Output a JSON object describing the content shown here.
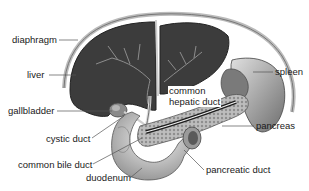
{
  "diagram": {
    "type": "anatomical-illustration",
    "labels": [
      {
        "id": "diaphragm",
        "text": "diaphragm"
      },
      {
        "id": "liver",
        "text": "liver"
      },
      {
        "id": "gallbladder",
        "text": "gallbladder"
      },
      {
        "id": "cystic-duct",
        "text": "cystic duct"
      },
      {
        "id": "common-bile-duct",
        "text": "common bile duct"
      },
      {
        "id": "duodenum",
        "text": "duodenum"
      },
      {
        "id": "common-hepatic-duct-line1",
        "text": "common"
      },
      {
        "id": "common-hepatic-duct-line2",
        "text": "hepatic duct"
      },
      {
        "id": "spleen",
        "text": "spleen"
      },
      {
        "id": "pancreas",
        "text": "pancreas"
      },
      {
        "id": "pancreatic-duct",
        "text": "pancreatic duct"
      }
    ],
    "colors": {
      "background": "#ffffff",
      "organ_dark": "#3a3a3a",
      "organ_mid": "#8a8a8a",
      "organ_light": "#d4d4d4",
      "leader_line": "#555555",
      "label_text": "#1a1a1a"
    }
  }
}
